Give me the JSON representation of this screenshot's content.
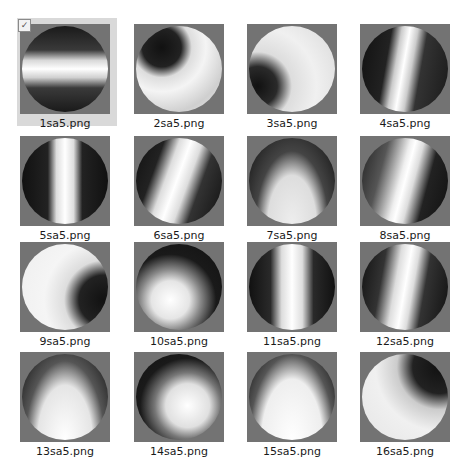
{
  "view": "file-explorer-large-icons",
  "selected_index": 0,
  "items": [
    {
      "name": "1sa5.png",
      "selected": true,
      "bg": "linear-gradient(180deg,#1a1a1a 0%,#3a3a3a 28%,#d8d8d8 40%,#ffffff 50%,#d0d0d0 60%,#3a3a3a 72%,#1a1a1a 100%)"
    },
    {
      "name": "2sa5.png",
      "selected": false,
      "bg": "radial-gradient(circle at 30% 25%,#111 0%,#222 22%,#ddd 34%,#f4f4f4 50%,#cfcfcf 75%,#e8e8e8 100%)"
    },
    {
      "name": "3sa5.png",
      "selected": false,
      "bg": "radial-gradient(circle at 10% 70%,#111 0%,#2a2a2a 20%,#ddd 35%,#f0f0f0 60%,#d8d8d8 100%)"
    },
    {
      "name": "4sa5.png",
      "selected": false,
      "bg": "linear-gradient(100deg,#111 0%,#222 30%,#ccc 40%,#fff 48%,#ccc 56%,#333 66%,#1a1a1a 100%)"
    },
    {
      "name": "5sa5.png",
      "selected": false,
      "bg": "linear-gradient(90deg,#111 0%,#222 30%,#ddd 40%,#fff 50%,#ddd 60%,#222 70%,#111 100%)"
    },
    {
      "name": "6sa5.png",
      "selected": false,
      "bg": "linear-gradient(110deg,#111 0%,#222 25%,#ddd 38%,#fff 48%,#ddd 58%,#333 70%,#111 100%)"
    },
    {
      "name": "7sa5.png",
      "selected": false,
      "bg": "radial-gradient(ellipse at 50% 100%,#eee 0%,#ddd 40%,#444 60%,#111 100%)"
    },
    {
      "name": "8sa5.png",
      "selected": false,
      "bg": "linear-gradient(105deg,#222 0%,#555 25%,#eee 45%,#fff 50%,#ddd 58%,#222 72%,#111 100%)"
    },
    {
      "name": "9sa5.png",
      "selected": false,
      "bg": "radial-gradient(circle at 95% 65%,#111 0%,#222 25%,#ddd 40%,#f5f5f5 60%,#eeeeee 100%)"
    },
    {
      "name": "10sa5.png",
      "selected": false,
      "bg": "radial-gradient(circle at 40% 65%,#fff 0%,#e5e5e5 25%,#888 40%,#1a1a1a 60%,#111 100%)"
    },
    {
      "name": "11sa5.png",
      "selected": false,
      "bg": "linear-gradient(90deg,#111 0%,#2a2a2a 25%,#ddd 38%,#fff 50%,#ddd 62%,#2a2a2a 75%,#111 100%)"
    },
    {
      "name": "12sa5.png",
      "selected": false,
      "bg": "linear-gradient(100deg,#111 0%,#333 25%,#ddd 40%,#fff 50%,#ddd 58%,#333 70%,#111 100%)"
    },
    {
      "name": "13sa5.png",
      "selected": false,
      "bg": "radial-gradient(ellipse at 50% 100%,#fff 0%,#e5e5e5 45%,#555 65%,#111 100%)"
    },
    {
      "name": "14sa5.png",
      "selected": false,
      "bg": "radial-gradient(circle at 60% 60%,#fff 0%,#e0e0e0 30%,#777 45%,#1a1a1a 65%,#111 100%)"
    },
    {
      "name": "15sa5.png",
      "selected": false,
      "bg": "radial-gradient(ellipse at 50% 100%,#fff 0%,#eee 50%,#555 70%,#111 100%)"
    },
    {
      "name": "16sa5.png",
      "selected": false,
      "bg": "radial-gradient(circle at 90% 15%,#111 0%,#222 25%,#ccc 40%,#f0f0f0 60%,#e5e5e5 100%)"
    }
  ],
  "layout": {
    "columns_x": [
      17,
      131,
      244,
      357
    ],
    "rows_y": [
      18,
      130,
      236,
      346
    ]
  },
  "checkbox_glyph": "✓"
}
